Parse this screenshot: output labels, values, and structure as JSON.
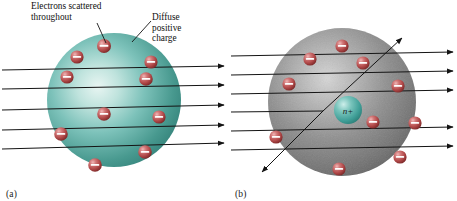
{
  "figure": {
    "background_color": "#ffffff"
  },
  "panels": [
    {
      "id": "a",
      "caption": "(a)",
      "model_name": "plum-pudding-model",
      "sphere": {
        "name": "diffuse-positive-charge-sphere",
        "color": "#4a9e96",
        "highlight_color": "#cfe9e4",
        "edge_color": "#2e7a73",
        "cx": 114,
        "cy": 100,
        "r": 67
      },
      "annotations": [
        {
          "name": "electrons-scattered-label",
          "text": "Electrons scattered\nthroughout",
          "leader_from": [
            97,
            23
          ],
          "leader_to": [
            106,
            44
          ]
        },
        {
          "name": "diffuse-positive-charge-label",
          "text": "Diffuse\npositive\ncharge",
          "leader_from": [
            150,
            21
          ],
          "leader_to": [
            131,
            42
          ]
        }
      ],
      "electrons": [
        {
          "cx": 104,
          "cy": 46,
          "r": 7.0
        },
        {
          "cx": 77,
          "cy": 57,
          "r": 6.6
        },
        {
          "cx": 151,
          "cy": 62,
          "r": 6.6
        },
        {
          "cx": 67,
          "cy": 77,
          "r": 6.6
        },
        {
          "cx": 146,
          "cy": 79,
          "r": 6.8
        },
        {
          "cx": 104,
          "cy": 114,
          "r": 6.8
        },
        {
          "cx": 159,
          "cy": 117,
          "r": 6.6
        },
        {
          "cx": 61,
          "cy": 134,
          "r": 6.8
        },
        {
          "cx": 145,
          "cy": 152,
          "r": 6.8
        },
        {
          "cx": 95,
          "cy": 165,
          "r": 6.8
        }
      ],
      "rays": [
        {
          "name": "alpha-ray-1",
          "y_in": 70,
          "y_out": 67,
          "deflected": false
        },
        {
          "name": "alpha-ray-2",
          "y_in": 89,
          "y_out": 86,
          "deflected": false
        },
        {
          "name": "alpha-ray-3",
          "y_in": 110,
          "y_out": 106,
          "deflected": false
        },
        {
          "name": "alpha-ray-4",
          "y_in": 130,
          "y_out": 126,
          "deflected": false
        },
        {
          "name": "alpha-ray-5",
          "y_in": 149,
          "y_out": 144,
          "deflected": false
        }
      ]
    },
    {
      "id": "b",
      "caption": "(b)",
      "model_name": "nuclear-model",
      "sphere": {
        "name": "atom-volume-sphere",
        "color": "#8a8a8a",
        "highlight_color": "#c9c9c9",
        "edge_color": "#5e5e5e",
        "cx": 113,
        "cy": 102,
        "r": 74
      },
      "nucleus": {
        "name": "nucleus",
        "label": "n+",
        "color": "#3f9e97",
        "highlight_color": "#a9ded8",
        "cx": 119,
        "cy": 110,
        "r": 14
      },
      "electrons": [
        {
          "cx": 113,
          "cy": 46,
          "r": 6.6
        },
        {
          "cx": 81,
          "cy": 59,
          "r": 6.6
        },
        {
          "cx": 134,
          "cy": 63,
          "r": 6.6
        },
        {
          "cx": 60,
          "cy": 84,
          "r": 6.6
        },
        {
          "cx": 169,
          "cy": 86,
          "r": 6.6
        },
        {
          "cx": 144,
          "cy": 122,
          "r": 6.6
        },
        {
          "cx": 186,
          "cy": 123,
          "r": 6.6
        },
        {
          "cx": 47,
          "cy": 137,
          "r": 6.6
        },
        {
          "cx": 171,
          "cy": 157,
          "r": 6.6
        },
        {
          "cx": 110,
          "cy": 169,
          "r": 6.6
        }
      ],
      "rays": [
        {
          "name": "alpha-ray-1",
          "y_in": 56,
          "y_out": 52,
          "deflected": false
        },
        {
          "name": "alpha-ray-2",
          "y_in": 75,
          "y_out": 71,
          "deflected": false
        },
        {
          "name": "alpha-ray-3",
          "y_in": 94,
          "y_out": 90,
          "deflected": false
        },
        {
          "name": "alpha-ray-4",
          "y_in": 131,
          "y_out": 127,
          "deflected": false
        },
        {
          "name": "alpha-ray-5",
          "y_in": 150,
          "y_out": 146,
          "deflected": false
        },
        {
          "name": "alpha-ray-deflected-in",
          "y_in": 112,
          "deflected": true
        },
        {
          "name": "alpha-ray-deflected-out-up",
          "deflected": true
        },
        {
          "name": "alpha-ray-deflected-out-down",
          "deflected": true
        }
      ]
    }
  ],
  "electron_style": {
    "name": "electron-sphere",
    "fill_color": "#b54a4a",
    "highlight_color": "#e9a0a0",
    "edge_color": "#7a2626",
    "sign_color": "#ffffff",
    "sign": "minus"
  },
  "ray_style": {
    "color": "#141414",
    "arrowhead": "filled-triangle"
  }
}
